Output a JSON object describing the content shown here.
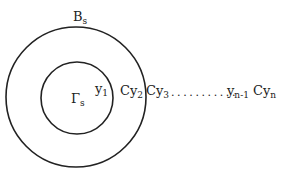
{
  "diagram": {
    "outer_circle": {
      "label_main": "B",
      "label_sub": "s",
      "cx": 76,
      "cy": 97,
      "r": 70
    },
    "inner_circle": {
      "label_main": "Γ",
      "label_sub": "s",
      "cx": 77,
      "cy": 98,
      "r": 36
    },
    "labels": {
      "y1": {
        "main": "y",
        "sub": "1"
      },
      "cy2": {
        "main": "Cy",
        "sub": "2"
      },
      "cy3": {
        "main": "Cy",
        "sub": "3"
      },
      "dots": "...........",
      "yn1": {
        "main": "y",
        "sub": "n-1"
      },
      "cyn": {
        "main": "Cy",
        "sub": "n"
      }
    },
    "stroke_color": "#222222"
  }
}
